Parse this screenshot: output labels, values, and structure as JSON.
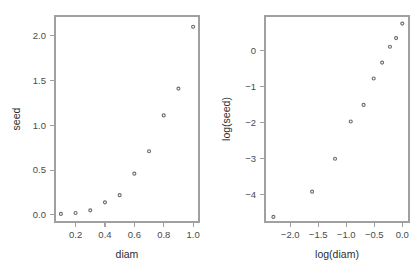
{
  "figure": {
    "background_color": "#ffffff",
    "point_color": "#6e6e6e",
    "axis_color": "#a0a0a0",
    "text_color": "#3a3a3a"
  },
  "chart_data": [
    {
      "type": "scatter",
      "panel": "left",
      "title": "",
      "xlabel": "diam",
      "ylabel": "seed",
      "xlim": [
        0.06,
        1.04
      ],
      "ylim": [
        -0.08,
        2.22
      ],
      "xticks": [
        0.2,
        0.4,
        0.6,
        0.8,
        1.0
      ],
      "xticklabels": [
        "0.2",
        "0.4",
        "0.6",
        "0.8",
        "1.0"
      ],
      "yticks": [
        0.0,
        0.5,
        1.0,
        1.5,
        2.0
      ],
      "yticklabels": [
        "0.0",
        "0.5",
        "1.0",
        "1.5",
        "2.0"
      ],
      "grid": false,
      "legend": null,
      "marker": "open-circle",
      "x": [
        0.1,
        0.2,
        0.3,
        0.4,
        0.5,
        0.6,
        0.7,
        0.8,
        0.9,
        1.0
      ],
      "y": [
        0.01,
        0.02,
        0.05,
        0.14,
        0.22,
        0.46,
        0.71,
        1.11,
        1.41,
        2.1
      ]
    },
    {
      "type": "scatter",
      "panel": "right",
      "title": "",
      "xlabel": "log(diam)",
      "ylabel": "log(seed)",
      "xlim": [
        -2.45,
        0.12
      ],
      "ylim": [
        -4.75,
        0.95
      ],
      "xticks": [
        -2.0,
        -1.5,
        -1.0,
        -0.5,
        0.0
      ],
      "xticklabels": [
        "−2.0",
        "−1.5",
        "−1.0",
        "−0.5",
        "0.0"
      ],
      "yticks": [
        -4,
        -3,
        -2,
        -1,
        0
      ],
      "yticklabels": [
        "−4",
        "−3",
        "−2",
        "−1",
        "0"
      ],
      "grid": false,
      "legend": null,
      "marker": "open-circle",
      "x": [
        -2.3,
        -1.61,
        -1.2,
        -0.92,
        -0.69,
        -0.51,
        -0.36,
        -0.22,
        -0.11,
        0.0
      ],
      "y": [
        -4.61,
        -3.91,
        -3.0,
        -1.97,
        -1.51,
        -0.78,
        -0.34,
        0.1,
        0.34,
        0.74
      ]
    }
  ]
}
